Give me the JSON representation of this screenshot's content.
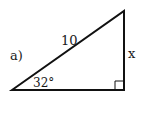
{
  "figure": {
    "problem_label": "a)",
    "hypotenuse_label": "10",
    "opposite_label": "x",
    "angle_label": "32°",
    "colors": {
      "stroke": "#111111",
      "text": "#1a1a1a",
      "background": "#ffffff"
    }
  }
}
